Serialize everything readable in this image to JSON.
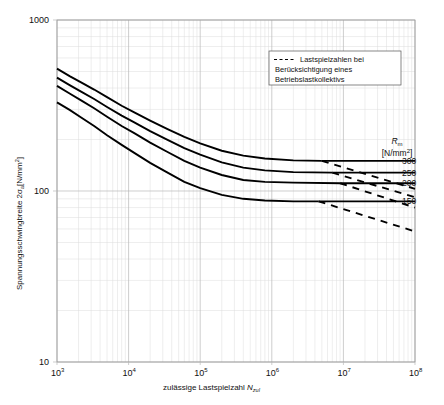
{
  "chart_data": {
    "type": "line",
    "title": "",
    "xlabel": "zulässige Lastspielzahl N_zul",
    "ylabel": "Spannungsschwingbreite 2·σ_a [N/mm²]",
    "xscale": "log",
    "yscale": "log",
    "xlim": [
      1000,
      100000000
    ],
    "ylim": [
      10,
      1000
    ],
    "grid": true,
    "xticks": [
      {
        "value": 1000,
        "label": "10",
        "exponent": "3"
      },
      {
        "value": 10000,
        "label": "10",
        "exponent": "4"
      },
      {
        "value": 100000,
        "label": "10",
        "exponent": "5"
      },
      {
        "value": 1000000,
        "label": "10",
        "exponent": "6"
      },
      {
        "value": 10000000,
        "label": "10",
        "exponent": "7"
      },
      {
        "value": 100000000,
        "label": "10",
        "exponent": "8"
      }
    ],
    "yticks": [
      {
        "value": 10,
        "label": "10"
      },
      {
        "value": 100,
        "label": "100"
      },
      {
        "value": 1000,
        "label": "1000"
      }
    ],
    "legend": {
      "position": "upper-right-inside",
      "entries": [
        {
          "style": "dashed",
          "lines": [
            "Lastspielzahlen bei",
            "Berücksichtigung eines",
            "Betriebslastkollektivs"
          ]
        }
      ]
    },
    "right_axis": {
      "title": "R",
      "title_sub": "m",
      "units": "[N/mm²]",
      "labels": [
        "300",
        "250",
        "200",
        "150"
      ]
    },
    "series": [
      {
        "name": "Rm = 300 N/mm²",
        "rm": 300,
        "style": "solid-with-dashed-extension",
        "endurance_limit": 150,
        "knee_x": 5000000,
        "points": [
          [
            1000,
            520
          ],
          [
            1500,
            470
          ],
          [
            2200,
            430
          ],
          [
            3300,
            392
          ],
          [
            5000,
            354
          ],
          [
            8000,
            315
          ],
          [
            12000,
            288
          ],
          [
            20000,
            258
          ],
          [
            35000,
            230
          ],
          [
            60000,
            207
          ],
          [
            100000,
            190
          ],
          [
            200000,
            172
          ],
          [
            400000,
            161
          ],
          [
            800000,
            155
          ],
          [
            2000000,
            151
          ],
          [
            5000000,
            150
          ]
        ],
        "plateau": [
          [
            5000000,
            150
          ],
          [
            100000000,
            150
          ]
        ],
        "dashed_extension": [
          [
            5000000,
            150
          ],
          [
            100000000,
            103
          ]
        ]
      },
      {
        "name": "Rm = 250 N/mm²",
        "rm": 250,
        "style": "solid-with-dashed-extension",
        "endurance_limit": 128,
        "knee_x": 7000000,
        "points": [
          [
            1000,
            460
          ],
          [
            1500,
            416
          ],
          [
            2200,
            380
          ],
          [
            3300,
            345
          ],
          [
            5000,
            310
          ],
          [
            8000,
            276
          ],
          [
            12000,
            252
          ],
          [
            20000,
            224
          ],
          [
            35000,
            199
          ],
          [
            60000,
            178
          ],
          [
            100000,
            163
          ],
          [
            200000,
            147
          ],
          [
            400000,
            137
          ],
          [
            800000,
            132
          ],
          [
            2000000,
            129
          ],
          [
            7000000,
            128
          ]
        ],
        "plateau": [
          [
            7000000,
            128
          ],
          [
            100000000,
            128
          ]
        ],
        "dashed_extension": [
          [
            7000000,
            128
          ],
          [
            100000000,
            92
          ]
        ]
      },
      {
        "name": "Rm = 200 N/mm²",
        "rm": 200,
        "style": "solid-with-dashed-extension",
        "endurance_limit": 111,
        "knee_x": 9000000,
        "points": [
          [
            1000,
            412
          ],
          [
            1500,
            372
          ],
          [
            2200,
            338
          ],
          [
            3300,
            305
          ],
          [
            5000,
            272
          ],
          [
            8000,
            240
          ],
          [
            12000,
            218
          ],
          [
            20000,
            192
          ],
          [
            35000,
            169
          ],
          [
            60000,
            150
          ],
          [
            100000,
            137
          ],
          [
            200000,
            124
          ],
          [
            400000,
            116
          ],
          [
            800000,
            113
          ],
          [
            2000000,
            112
          ],
          [
            9000000,
            111
          ]
        ],
        "plateau": [
          [
            9000000,
            111
          ],
          [
            100000000,
            111
          ]
        ],
        "dashed_extension": [
          [
            9000000,
            111
          ],
          [
            100000000,
            80
          ]
        ]
      },
      {
        "name": "Rm = 150 N/mm²",
        "rm": 150,
        "style": "solid-with-dashed-extension",
        "endurance_limit": 87,
        "knee_x": 4500000,
        "points": [
          [
            1000,
            330
          ],
          [
            1500,
            298
          ],
          [
            2200,
            268
          ],
          [
            3300,
            240
          ],
          [
            5000,
            212
          ],
          [
            8000,
            186
          ],
          [
            12000,
            167
          ],
          [
            20000,
            146
          ],
          [
            35000,
            128
          ],
          [
            60000,
            113
          ],
          [
            100000,
            104
          ],
          [
            200000,
            95
          ],
          [
            400000,
            90
          ],
          [
            800000,
            88
          ],
          [
            2000000,
            87
          ],
          [
            4500000,
            87
          ]
        ],
        "plateau": [
          [
            4500000,
            87
          ],
          [
            100000000,
            87
          ]
        ],
        "dashed_extension": [
          [
            4500000,
            87
          ],
          [
            100000000,
            58
          ]
        ]
      }
    ]
  }
}
